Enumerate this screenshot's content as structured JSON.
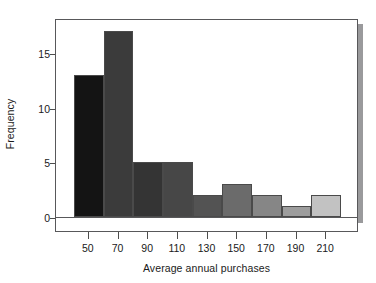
{
  "chart_data": {
    "type": "bar",
    "title": "",
    "subtitle": "",
    "xlabel": "Average annual purchases",
    "ylabel": "Frequency",
    "categories": [
      "50",
      "70",
      "90",
      "110",
      "130",
      "150",
      "170",
      "190",
      "210"
    ],
    "values": [
      13,
      17,
      5,
      5,
      2,
      3,
      2,
      1,
      2
    ],
    "bin_width": 20,
    "bin_edges": [
      40,
      60,
      80,
      100,
      120,
      140,
      160,
      180,
      200,
      220
    ],
    "x_tick_labels": [
      "50",
      "70",
      "90",
      "110",
      "130",
      "150",
      "170",
      "190",
      "210"
    ],
    "y_tick_labels": [
      "0",
      "5",
      "10",
      "15"
    ],
    "y_ticks": [
      0,
      5,
      10,
      15
    ],
    "ylim": [
      0,
      18.2
    ],
    "xlim": [
      40,
      220
    ],
    "grid": false,
    "legend": false,
    "legend_position": "none",
    "bar_colors": [
      "#141414",
      "#3b3b3b",
      "#343434",
      "#474747",
      "#535353",
      "#6b6b6b",
      "#868686",
      "#9d9d9d",
      "#c2c2c2"
    ],
    "bar_edge_color": "#4a4a4a",
    "axis_color": "#58585a",
    "text_color": "#1a1a1a",
    "background": "#ffffff",
    "shadow_color": "#9a9a9c"
  }
}
